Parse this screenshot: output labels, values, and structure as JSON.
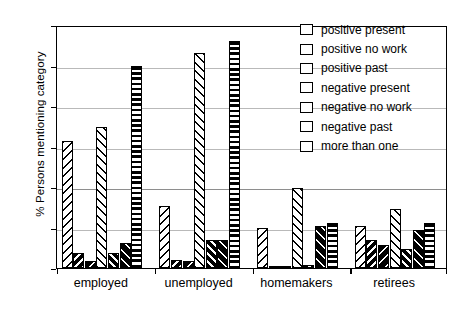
{
  "chart_data": {
    "type": "bar",
    "title": "",
    "xlabel": "",
    "ylabel": "% Persons mentioning category",
    "ylim": [
      0,
      30
    ],
    "yticks": [
      0,
      5,
      10,
      15,
      20,
      25,
      30
    ],
    "grid": true,
    "legend_position": "top-right",
    "categories": [
      "employed",
      "unemployed",
      "homemakers",
      "retirees"
    ],
    "series": [
      {
        "name": "positive present",
        "pattern": "hatch-back-sparse",
        "values": [
          15.7,
          7.6,
          5.0,
          5.2
        ]
      },
      {
        "name": "positive no work",
        "pattern": "hatch-back-medium",
        "values": [
          1.9,
          1.0,
          0.3,
          3.5
        ]
      },
      {
        "name": "positive past",
        "pattern": "hatch-back-dense",
        "values": [
          0.9,
          0.9,
          0.3,
          2.9
        ]
      },
      {
        "name": "negative present",
        "pattern": "hatch-fwd-sparse",
        "values": [
          17.4,
          26.5,
          9.9,
          7.3
        ]
      },
      {
        "name": "negative no work",
        "pattern": "hatch-fwd-medium",
        "values": [
          1.8,
          3.5,
          0.4,
          2.4
        ]
      },
      {
        "name": "negative past",
        "pattern": "hatch-fwd-dense",
        "values": [
          3.1,
          3.4,
          5.2,
          4.7
        ]
      },
      {
        "name": "more than one",
        "pattern": "horizontal-stripes",
        "values": [
          25.0,
          28.0,
          5.5,
          5.5
        ]
      }
    ]
  },
  "axis": {
    "ylabel": "% Persons mentioning category",
    "yticks": [
      "0",
      "5",
      "10",
      "15",
      "20",
      "25",
      "30"
    ],
    "xticks": [
      "employed",
      "unemployed",
      "homemakers",
      "retirees"
    ]
  },
  "legend": {
    "items": [
      {
        "label": "positive present"
      },
      {
        "label": "positive no work"
      },
      {
        "label": "positive past"
      },
      {
        "label": "negative present"
      },
      {
        "label": "negative no work"
      },
      {
        "label": "negative past"
      },
      {
        "label": "more than one"
      }
    ]
  },
  "colors": {
    "ink": "#000000",
    "grid": "#b9b9b9",
    "background": "#ffffff"
  }
}
